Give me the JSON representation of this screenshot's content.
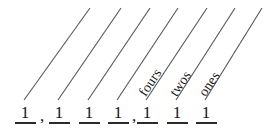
{
  "figure": {
    "type": "place-value-diagram",
    "background_color": "#ffffff",
    "ink_color": "#141414",
    "line_color": "#5a5a5a",
    "width": 268,
    "height": 130
  },
  "pointer_lines": [
    {
      "index": 0,
      "x1": 24,
      "y1": 100,
      "x2": 90,
      "y2": 8,
      "label": ""
    },
    {
      "index": 1,
      "x1": 58,
      "y1": 100,
      "x2": 121,
      "y2": 8,
      "label": ""
    },
    {
      "index": 2,
      "x1": 88,
      "y1": 100,
      "x2": 150,
      "y2": 8,
      "label": ""
    },
    {
      "index": 3,
      "x1": 117,
      "y1": 100,
      "x2": 178,
      "y2": 8,
      "label": ""
    },
    {
      "index": 4,
      "x1": 146,
      "y1": 100,
      "x2": 207,
      "y2": 8,
      "label": "fours"
    },
    {
      "index": 5,
      "x1": 176,
      "y1": 100,
      "x2": 235,
      "y2": 8,
      "label": "twos"
    },
    {
      "index": 6,
      "x1": 205,
      "y1": 100,
      "x2": 262,
      "y2": 8,
      "label": "ones"
    }
  ],
  "place_labels": [
    {
      "text": "fours",
      "x": 148,
      "y": 99,
      "rotation_deg": -56
    },
    {
      "text": "twos",
      "x": 179,
      "y": 99,
      "rotation_deg": -56
    },
    {
      "text": "ones",
      "x": 208,
      "y": 99,
      "rotation_deg": -56
    }
  ],
  "digit_row": {
    "digits": [
      {
        "value": "1",
        "x": 14
      },
      {
        "value": "1",
        "x": 48
      },
      {
        "value": "1",
        "x": 78
      },
      {
        "value": "1",
        "x": 107
      },
      {
        "value": "1",
        "x": 136
      },
      {
        "value": "1",
        "x": 166
      },
      {
        "value": "1",
        "x": 195
      }
    ],
    "separators": [
      {
        "mark": ",",
        "x": 38
      },
      {
        "mark": ",",
        "x": 130
      }
    ]
  }
}
